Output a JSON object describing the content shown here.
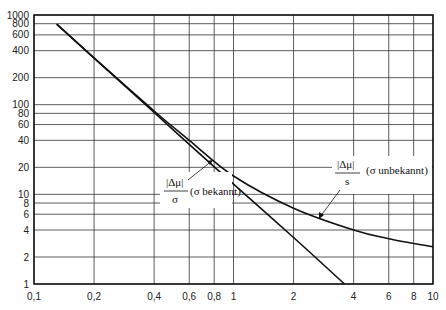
{
  "chart_data": {
    "type": "line",
    "title": "",
    "xlabel": "",
    "ylabel": "",
    "xscale": "log",
    "yscale": "log",
    "xlim": [
      0.1,
      10
    ],
    "ylim": [
      1,
      1000
    ],
    "grid": true,
    "x_ticks": [
      0.1,
      0.2,
      0.4,
      0.6,
      0.8,
      1,
      2,
      4,
      6,
      8,
      10
    ],
    "x_tick_labels": [
      "0,1",
      "0,2",
      "0,4",
      "0,6",
      "0,8",
      "1",
      "2",
      "4",
      "6",
      "8",
      "10"
    ],
    "y_ticks": [
      1,
      2,
      4,
      6,
      8,
      10,
      20,
      40,
      60,
      80,
      100,
      200,
      400,
      600,
      800,
      1000
    ],
    "y_tick_labels": [
      "1",
      "2",
      "4",
      "6",
      "8",
      "10",
      "20",
      "40",
      "60",
      "80",
      "100",
      "200",
      "400",
      "600",
      "800",
      "1000"
    ],
    "series": [
      {
        "name": "|Δμ|/σ (σ bekannt)",
        "x": [
          0.13,
          0.2,
          0.4,
          0.6,
          1,
          2,
          3.6
        ],
        "y": [
          790,
          330,
          82,
          36,
          13,
          3.3,
          1
        ]
      },
      {
        "name": "|Δμ|/s (σ unbekannt)",
        "x": [
          0.13,
          0.2,
          0.4,
          0.6,
          1,
          2,
          4,
          6,
          10
        ],
        "y": [
          790,
          332,
          85,
          40,
          16,
          7,
          4,
          3.2,
          2.6
        ]
      }
    ],
    "annotations": [
      {
        "numerator": "|Δμ|",
        "denominator": "σ",
        "label": "(σ bekannt)"
      },
      {
        "numerator": "|Δμ|",
        "denominator": "s",
        "label": "(σ unbekannt)"
      }
    ]
  }
}
